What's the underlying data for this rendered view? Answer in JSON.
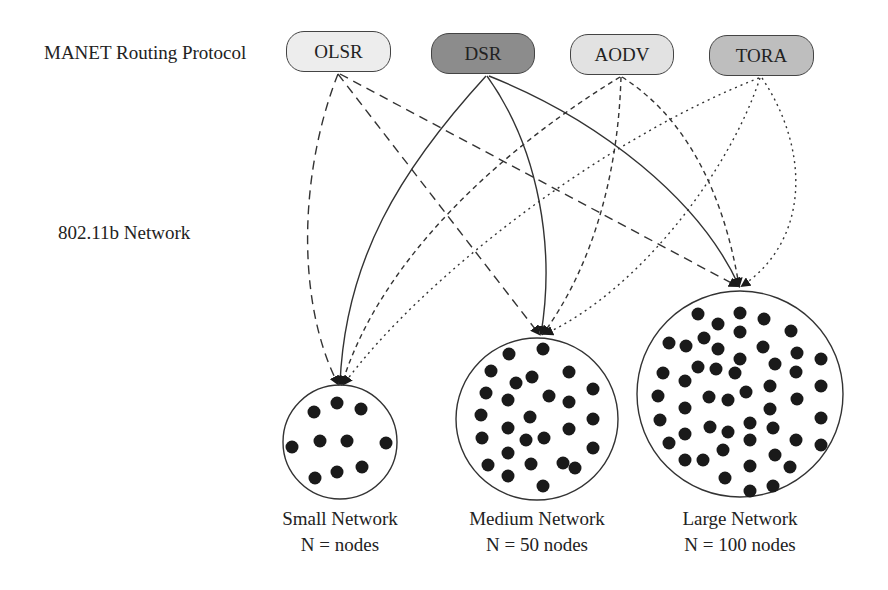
{
  "labels": {
    "protocol_row": "MANET Routing Protocol",
    "network_row": "802.11b Network"
  },
  "protocols": [
    {
      "name": "OLSR",
      "fill": "#ededed",
      "line_style": "long-dash"
    },
    {
      "name": "DSR",
      "fill": "#8c8c8c",
      "line_style": "solid"
    },
    {
      "name": "AODV",
      "fill": "#e2e2e2",
      "line_style": "short-dash"
    },
    {
      "name": "TORA",
      "fill": "#bebebe",
      "line_style": "dotted"
    }
  ],
  "networks": [
    {
      "title": "Small Network",
      "nodes_label": "N = nodes"
    },
    {
      "title": "Medium Network",
      "nodes_label": "N = 50 nodes"
    },
    {
      "title": "Large Network",
      "nodes_label": "N = 100 nodes"
    }
  ],
  "edges": [
    {
      "from": "OLSR",
      "to": "Small Network"
    },
    {
      "from": "OLSR",
      "to": "Medium Network"
    },
    {
      "from": "OLSR",
      "to": "Large Network"
    },
    {
      "from": "DSR",
      "to": "Small Network"
    },
    {
      "from": "DSR",
      "to": "Medium Network"
    },
    {
      "from": "DSR",
      "to": "Large Network"
    },
    {
      "from": "AODV",
      "to": "Small Network"
    },
    {
      "from": "AODV",
      "to": "Medium Network"
    },
    {
      "from": "AODV",
      "to": "Large Network"
    },
    {
      "from": "TORA",
      "to": "Small Network"
    },
    {
      "from": "TORA",
      "to": "Medium Network"
    },
    {
      "from": "TORA",
      "to": "Large Network"
    }
  ]
}
